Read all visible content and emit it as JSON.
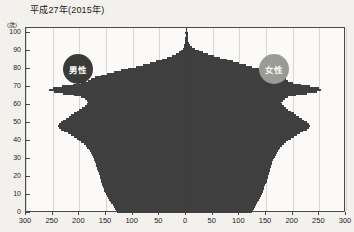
{
  "title": "平成27年(2015年)",
  "axes": {
    "y_unit_label": "(歳)",
    "y_ticks": [
      "100",
      "90",
      "80",
      "70",
      "60",
      "50",
      "40",
      "30",
      "20",
      "10",
      "0"
    ],
    "x_ticks_left": [
      "300",
      "250",
      "200",
      "150",
      "100",
      "50"
    ],
    "x_tick_center": "0",
    "x_ticks_right": [
      "50",
      "100",
      "150",
      "200",
      "250",
      "300"
    ]
  },
  "legend": {
    "male_label": "男性",
    "female_label": "女性",
    "male_color": "#3a3a38",
    "female_color": "#9b9b96"
  },
  "colors": {
    "male_bar": "#8c8c88",
    "male_bar_young": "#aaaaa5",
    "female_bar": "#b9b9b3",
    "female_bar_young": "#dedcd5",
    "bar_outline": "#3f3f3f",
    "plot_background": "#fbfaf8",
    "page_background": "#f3f1ed",
    "grid": "#d8d6d1",
    "axis": "#3a3a3a"
  },
  "chart_data": {
    "type": "bar",
    "subtype": "population-pyramid",
    "title": "平成27年(2015年)",
    "xlabel": "",
    "ylabel": "(歳)",
    "xlim": [
      -300,
      300
    ],
    "ylim": [
      0,
      103
    ],
    "grid": true,
    "legend_position": "inside-plot",
    "unit_note": "千人 (thousands of persons) per single year of age",
    "categories": [
      0,
      1,
      2,
      3,
      4,
      5,
      6,
      7,
      8,
      9,
      10,
      11,
      12,
      13,
      14,
      15,
      16,
      17,
      18,
      19,
      20,
      21,
      22,
      23,
      24,
      25,
      26,
      27,
      28,
      29,
      30,
      31,
      32,
      33,
      34,
      35,
      36,
      37,
      38,
      39,
      40,
      41,
      42,
      43,
      44,
      45,
      46,
      47,
      48,
      49,
      50,
      51,
      52,
      53,
      54,
      55,
      56,
      57,
      58,
      59,
      60,
      61,
      62,
      63,
      64,
      65,
      66,
      67,
      68,
      69,
      70,
      71,
      72,
      73,
      74,
      75,
      76,
      77,
      78,
      79,
      80,
      81,
      82,
      83,
      84,
      85,
      86,
      87,
      88,
      89,
      90,
      91,
      92,
      93,
      94,
      95,
      96,
      97,
      98,
      99,
      100
    ],
    "series": [
      {
        "name": "男性",
        "side": "left",
        "values": [
          130,
          131,
          133,
          135,
          137,
          140,
          142,
          144,
          146,
          148,
          150,
          152,
          153,
          154,
          155,
          157,
          158,
          159,
          160,
          161,
          162,
          163,
          164,
          165,
          166,
          167,
          168,
          169,
          170,
          172,
          173,
          174,
          176,
          178,
          180,
          182,
          185,
          188,
          192,
          196,
          200,
          205,
          210,
          216,
          222,
          228,
          234,
          238,
          240,
          238,
          235,
          230,
          225,
          220,
          215,
          210,
          205,
          200,
          195,
          190,
          186,
          184,
          186,
          190,
          196,
          210,
          230,
          248,
          256,
          250,
          232,
          212,
          196,
          184,
          178,
          170,
          160,
          148,
          135,
          122,
          108,
          94,
          80,
          68,
          56,
          45,
          35,
          26,
          19,
          13,
          9,
          6,
          4,
          3,
          2,
          1,
          1,
          1,
          0,
          0,
          1
        ]
      },
      {
        "name": "女性",
        "side": "right",
        "values": [
          124,
          125,
          127,
          129,
          131,
          133,
          135,
          137,
          139,
          141,
          143,
          144,
          145,
          146,
          147,
          149,
          150,
          151,
          152,
          153,
          154,
          155,
          156,
          157,
          158,
          159,
          160,
          161,
          162,
          164,
          165,
          166,
          168,
          170,
          172,
          174,
          177,
          180,
          184,
          188,
          192,
          197,
          202,
          208,
          214,
          220,
          226,
          230,
          232,
          230,
          227,
          222,
          217,
          212,
          207,
          202,
          197,
          192,
          187,
          183,
          180,
          178,
          181,
          186,
          192,
          206,
          227,
          245,
          254,
          249,
          233,
          215,
          201,
          191,
          187,
          183,
          176,
          166,
          156,
          146,
          136,
          124,
          112,
          100,
          88,
          76,
          64,
          52,
          42,
          32,
          24,
          17,
          12,
          8,
          5,
          3,
          2,
          1,
          1,
          1,
          2
        ]
      }
    ]
  }
}
